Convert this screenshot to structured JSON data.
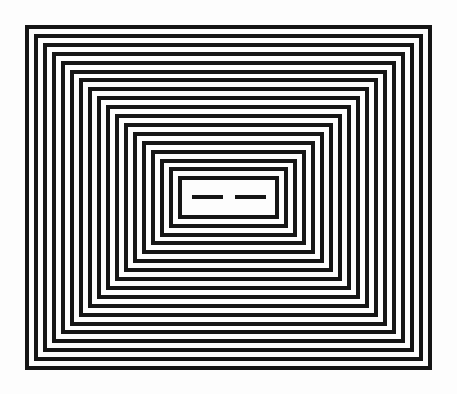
{
  "figure": {
    "width": 457,
    "height": 394,
    "background_color": "#fdfdfd",
    "stroke_color": "#151515",
    "outer_rect": {
      "x": 25,
      "y": 25,
      "w": 407,
      "h": 345
    },
    "ring_count": 18,
    "stroke_width": 4.5,
    "ring_step_x": 9.0,
    "ring_step_y": 8.9,
    "center_bars": [
      {
        "x": 192,
        "y": 195,
        "w": 31,
        "h": 4
      },
      {
        "x": 235,
        "y": 195,
        "w": 31,
        "h": 4
      }
    ]
  }
}
